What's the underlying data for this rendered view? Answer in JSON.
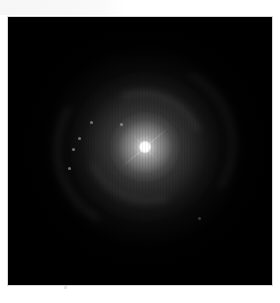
{
  "image": {
    "subject": "face-on spiral galaxy",
    "background_color": "#000000",
    "page_color": "#ffffff",
    "frame": {
      "left": 8,
      "top": 17,
      "width": 264,
      "height": 268
    },
    "core": {
      "x": 145,
      "y": 147,
      "color": "#ffffff"
    },
    "features": [
      "bright nucleus",
      "diffuse halo",
      "faint spiral arms",
      "diffraction spike",
      "star-forming knots"
    ]
  }
}
